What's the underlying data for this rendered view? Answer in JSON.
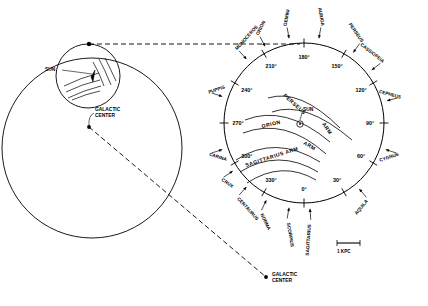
{
  "diagram": {
    "type": "astronomical-schematic",
    "background_color": "#ffffff",
    "line_color": "#000000"
  },
  "left_panel": {
    "name": "galaxy-overview",
    "galaxy_circle": {
      "cx": 92,
      "cy": 148,
      "r": 90
    },
    "inset_circle": {
      "cx": 88,
      "cy": 76,
      "r": 32
    },
    "sun_label": "SUN",
    "galactic_center_label_line1": "GALACTIC",
    "galactic_center_label_line2": "CENTER",
    "galactic_center_dot": {
      "x": 89,
      "y": 127
    }
  },
  "right_panel": {
    "name": "solar-neighbourhood-detail",
    "circle": {
      "cx": 304,
      "cy": 123,
      "r": 80
    },
    "sun_marker_label": "SUN",
    "galactic_center_label_line1": "GALACTIC",
    "galactic_center_label_line2": "CENTER"
  },
  "scale_bar": {
    "label": "1 KPC",
    "x1": 337,
    "x2": 360,
    "y": 243
  },
  "longitude_ticks": [
    {
      "label": "0°",
      "deg": 0
    },
    {
      "label": "30°",
      "deg": 30
    },
    {
      "label": "60°",
      "deg": 60
    },
    {
      "label": "90°",
      "deg": 90
    },
    {
      "label": "120°",
      "deg": 120
    },
    {
      "label": "150°",
      "deg": 150
    },
    {
      "label": "180°",
      "deg": 180
    },
    {
      "label": "210°",
      "deg": 210
    },
    {
      "label": "240°",
      "deg": 240
    },
    {
      "label": "270°",
      "deg": 270
    },
    {
      "label": "300°",
      "deg": 300
    },
    {
      "label": "330°",
      "deg": 330
    }
  ],
  "constellations": [
    {
      "label": "MONOCEROS",
      "deg": 222
    },
    {
      "label": "ORION",
      "deg": 207
    },
    {
      "label": "GEMINI",
      "deg": 190
    },
    {
      "label": "AURIGA",
      "deg": 170
    },
    {
      "label": "PERSEUS",
      "deg": 145
    },
    {
      "label": "CASSIOPEIA",
      "deg": 128
    },
    {
      "label": "CEPHEUS",
      "deg": 105
    },
    {
      "label": "CYGNUS",
      "deg": 72
    },
    {
      "label": "AQUILA",
      "deg": 40
    },
    {
      "label": "SAGITTARIUS",
      "deg": 4
    },
    {
      "label": "SCORPIUS",
      "deg": 350
    },
    {
      "label": "NORMA",
      "deg": 334
    },
    {
      "label": "CENTAURUS",
      "deg": 318
    },
    {
      "label": "CRUX",
      "deg": 304
    },
    {
      "label": "CARINA",
      "deg": 288
    },
    {
      "label": "PUPPIS",
      "deg": 252
    }
  ],
  "spiral_arms": [
    {
      "label": "PERSEUS ARM"
    },
    {
      "label": "ORION ARM"
    },
    {
      "label": "SAGITTARIUS ARM"
    }
  ],
  "arm_label_parts": {
    "perseus": "PERSEUS",
    "perseus_arm": "ARM",
    "orion": "ORION",
    "orion_arm": "ARM",
    "sagittarius_arm": "SAGITTARIUS ARM"
  }
}
